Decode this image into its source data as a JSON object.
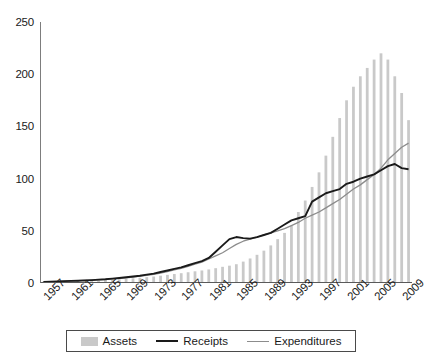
{
  "chart_data": {
    "type": "bar",
    "title": "",
    "subtitle": "",
    "xlabel": "",
    "ylabel": "",
    "xlim": [
      1957,
      2010
    ],
    "ylim": [
      0,
      250
    ],
    "y_ticks": [
      0,
      50,
      100,
      150,
      200,
      250
    ],
    "grid": false,
    "legend_position": "bottom",
    "x_tick_labels": [
      "1957",
      "1961",
      "1965",
      "1969",
      "1973",
      "1977",
      "1981",
      "1985",
      "1989",
      "1993",
      "1997",
      "2001",
      "2005",
      "2009"
    ],
    "x_tick_step": 4,
    "x": [
      1957,
      1958,
      1959,
      1960,
      1961,
      1962,
      1963,
      1964,
      1965,
      1966,
      1967,
      1968,
      1969,
      1970,
      1971,
      1972,
      1973,
      1974,
      1975,
      1976,
      1977,
      1978,
      1979,
      1980,
      1981,
      1982,
      1983,
      1984,
      1985,
      1986,
      1987,
      1988,
      1989,
      1990,
      1991,
      1992,
      1993,
      1994,
      1995,
      1996,
      1997,
      1998,
      1999,
      2000,
      2001,
      2002,
      2003,
      2004,
      2005,
      2006,
      2007,
      2008,
      2009,
      2010
    ],
    "series": [
      {
        "name": "Assets",
        "type": "bar",
        "color": "#c9c9c9",
        "values": [
          1.2,
          1.3,
          1.4,
          1.6,
          1.8,
          2.0,
          2.2,
          2.4,
          2.6,
          2.9,
          3.2,
          3.6,
          4.0,
          4.5,
          5.0,
          5.6,
          6.2,
          7.0,
          7.8,
          8.6,
          9.4,
          10.3,
          11.2,
          12.0,
          13.0,
          14.2,
          15.5,
          16.6,
          18.0,
          20.5,
          23.5,
          27.0,
          31.0,
          36.0,
          42.0,
          48.0,
          55.0,
          68.0,
          79.0,
          92.0,
          106.0,
          122.0,
          140.0,
          158.0,
          175.0,
          188.0,
          198.0,
          206.0,
          214.0,
          220.0,
          214.0,
          198.0,
          182.0,
          156.0
        ]
      },
      {
        "name": "Receipts",
        "type": "line",
        "color": "#1a1a1a",
        "values": [
          1.0,
          1.2,
          1.5,
          1.8,
          2.0,
          2.2,
          2.5,
          2.8,
          3.2,
          3.6,
          4.2,
          4.8,
          5.5,
          6.2,
          7.0,
          8.0,
          9.0,
          10.5,
          12.0,
          13.5,
          15.0,
          17.0,
          19.0,
          21.0,
          24.0,
          30.0,
          36.0,
          42.0,
          44.0,
          43.0,
          42.5,
          44.0,
          46.0,
          48.0,
          52.0,
          56.0,
          60.0,
          62.0,
          64.0,
          78.0,
          82.0,
          86.0,
          88.0,
          90.0,
          95.0,
          97.0,
          100.0,
          102.0,
          104.0,
          108.0,
          112.0,
          114.0,
          110.0,
          109.0
        ]
      },
      {
        "name": "Expenditures",
        "type": "line",
        "color": "#8c8c8c",
        "values": [
          1.0,
          1.2,
          1.4,
          1.7,
          1.9,
          2.2,
          2.4,
          2.7,
          3.0,
          3.4,
          3.9,
          4.4,
          5.0,
          5.7,
          6.5,
          7.3,
          8.2,
          9.5,
          11.0,
          12.5,
          14.0,
          16.0,
          18.0,
          20.0,
          23.0,
          26.0,
          29.0,
          33.0,
          37.0,
          40.0,
          42.0,
          44.0,
          46.0,
          48.0,
          50.0,
          52.0,
          55.0,
          58.0,
          62.0,
          65.0,
          68.0,
          72.0,
          76.0,
          80.0,
          85.0,
          90.0,
          94.0,
          99.0,
          104.0,
          110.0,
          118.0,
          124.0,
          130.0,
          134.0
        ]
      }
    ]
  },
  "legend": {
    "items": [
      {
        "label": "Assets",
        "marker": "bar-swatch"
      },
      {
        "label": "Receipts",
        "marker": "dark-line-swatch"
      },
      {
        "label": "Expenditures",
        "marker": "light-line-swatch"
      }
    ]
  }
}
